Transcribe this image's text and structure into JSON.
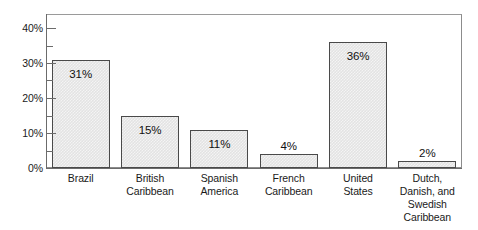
{
  "chart_data": {
    "type": "bar",
    "title": "",
    "subtitle": "",
    "xlabel": "",
    "ylabel": "",
    "categories": [
      "Brazil",
      "British Caribbean",
      "Spanish America",
      "French Caribbean",
      "United States",
      "Dutch, Danish, and Swedish Caribbean"
    ],
    "category_lines": [
      [
        "Brazil"
      ],
      [
        "British",
        "Caribbean"
      ],
      [
        "Spanish",
        "America"
      ],
      [
        "French",
        "Caribbean"
      ],
      [
        "United",
        "States"
      ],
      [
        "Dutch,",
        "Danish, and",
        "Swedish",
        "Caribbean"
      ]
    ],
    "values": [
      31,
      15,
      11,
      4,
      36,
      2
    ],
    "data_labels": [
      "31%",
      "15%",
      "11%",
      "4%",
      "36%",
      "2%"
    ],
    "data_label_position": [
      "inside",
      "inside",
      "inside",
      "outside",
      "inside",
      "outside"
    ],
    "ylim": [
      0,
      44
    ],
    "ytick_values": [
      0,
      10,
      20,
      30,
      40
    ],
    "ytick_labels": [
      "0%",
      "10%",
      "20%",
      "30%",
      "40%"
    ],
    "yminor_tick_values": [
      5,
      15,
      25,
      35
    ],
    "grid": false,
    "legend": null,
    "bar_fill_color": "#e3e3e3",
    "bar_border_color": "#4a4a4a",
    "axis_color": "#6b6b6b",
    "frame_color": "#8c8c8c",
    "text_color": "#1a1a1a"
  }
}
